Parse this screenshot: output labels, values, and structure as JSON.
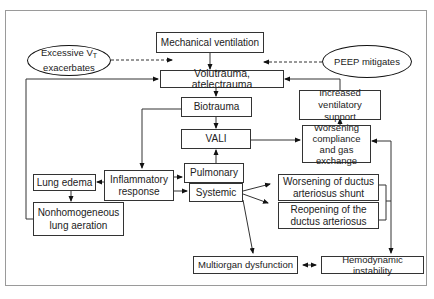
{
  "diagram": {
    "nodes": {
      "mechanical_ventilation": "Mechanical ventilation",
      "excessive_vt": {
        "line1_prefix": "Excessive V",
        "line1_sub": "T",
        "line2": "exacerbates"
      },
      "peep_mitigates": "PEEP mitigates",
      "volutrauma": "Volutrauma, atelectrauma",
      "biotrauma": "Biotrauma",
      "vali": "VALI",
      "increased_ventilatory_support": "Increased ventilatory support",
      "worsening_compliance": "Worsening compliance and gas exchange",
      "inflammatory_response": "Inflammatory response",
      "lung_edema": "Lung edema",
      "nonhomogeneous_aeration": "Nonhomogeneous lung aeration",
      "pulmonary": "Pulmonary",
      "systemic": "Systemic",
      "worsening_ductus_shunt": "Worsening of ductus arteriosus shunt",
      "reopening_ductus": "Reopening of the ductus arteriosus",
      "multiorgan_dysfunction": "Multiorgan dysfunction",
      "hemodynamic_instability": "Hemodynamic instability"
    },
    "edges": [
      {
        "from": "Mechanical ventilation",
        "to": "Volutrauma, atelectrauma",
        "style": "solid"
      },
      {
        "from": "Excessive VT exacerbates",
        "to": "Volutrauma, atelectrauma",
        "style": "dashed"
      },
      {
        "from": "PEEP mitigates",
        "to": "Volutrauma, atelectrauma",
        "style": "dashed"
      },
      {
        "from": "Volutrauma, atelectrauma",
        "to": "Biotrauma",
        "style": "solid"
      },
      {
        "from": "Biotrauma",
        "to": "VALI",
        "style": "solid"
      },
      {
        "from": "Biotrauma",
        "to": "Inflammatory response",
        "style": "solid"
      },
      {
        "from": "VALI",
        "to": "Worsening compliance and gas exchange",
        "style": "solid"
      },
      {
        "from": "Worsening compliance and gas exchange",
        "to": "Increased ventilatory support",
        "style": "solid"
      },
      {
        "from": "Increased ventilatory support",
        "to": "Volutrauma, atelectrauma",
        "style": "solid"
      },
      {
        "from": "Inflammatory response",
        "to": "Lung edema",
        "style": "solid"
      },
      {
        "from": "Inflammatory response",
        "to": "Pulmonary",
        "style": "solid"
      },
      {
        "from": "Inflammatory response",
        "to": "Systemic",
        "style": "solid"
      },
      {
        "from": "Pulmonary",
        "to": "VALI",
        "style": "solid"
      },
      {
        "from": "Lung edema",
        "to": "Nonhomogeneous lung aeration",
        "style": "solid"
      },
      {
        "from": "Nonhomogeneous lung aeration",
        "to": "Volutrauma, atelectrauma",
        "style": "solid"
      },
      {
        "from": "Systemic",
        "to": "Worsening of ductus arteriosus shunt",
        "style": "solid"
      },
      {
        "from": "Systemic",
        "to": "Reopening of the ductus arteriosus",
        "style": "solid"
      },
      {
        "from": "Systemic",
        "to": "Multiorgan dysfunction",
        "style": "solid"
      },
      {
        "from": "Ductus bracket",
        "to": "Worsening compliance and gas exchange",
        "style": "solid"
      },
      {
        "from": "Ductus bracket",
        "to": "Hemodynamic instability",
        "style": "solid"
      },
      {
        "from": "Multiorgan dysfunction",
        "to": "Hemodynamic instability",
        "style": "bidirectional"
      }
    ]
  }
}
